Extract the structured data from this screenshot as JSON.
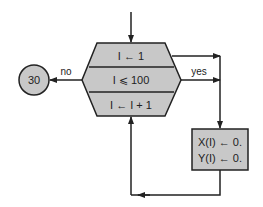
{
  "diagram": {
    "type": "flowchart",
    "loop_block": {
      "init": "I ← 1",
      "condition": "I ⩽ 100",
      "increment": "I ← I + 1"
    },
    "branch_labels": {
      "no": "no",
      "yes": "yes"
    },
    "connector": {
      "label": "30"
    },
    "process_box": {
      "line1": "X(I) ← 0.",
      "line2": "Y(I) ← 0."
    },
    "colors": {
      "fill": "#c8c8c8",
      "stroke": "#222222",
      "background": "#ffffff"
    }
  }
}
